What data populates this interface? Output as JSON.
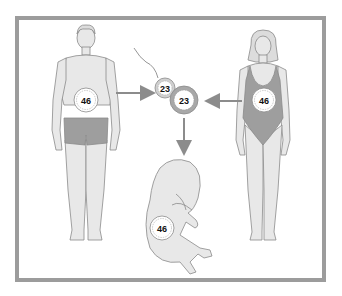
{
  "diagram": {
    "colors": {
      "frame": "#9c9c9c",
      "skin": "#e8e8e8",
      "outline": "#8a8a8a",
      "clothing": "#9e9e9e",
      "arrow": "#8c8c8c",
      "cell_ring": "#a8a8a8"
    },
    "male": {
      "label": "male",
      "chromosome_count": "46"
    },
    "female": {
      "label": "female",
      "chromosome_count": "46"
    },
    "sperm": {
      "label": "sperm",
      "chromosome_count": "23"
    },
    "egg": {
      "label": "egg",
      "chromosome_count": "23"
    },
    "fetus": {
      "label": "fetus",
      "chromosome_count": "46"
    },
    "arrows": [
      {
        "from": "male",
        "to": "sperm"
      },
      {
        "from": "female",
        "to": "egg"
      },
      {
        "from": "zygote",
        "to": "fetus"
      }
    ]
  }
}
